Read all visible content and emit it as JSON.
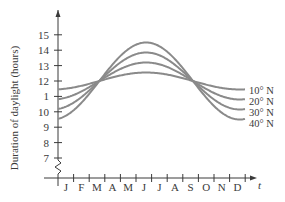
{
  "chart_data": {
    "type": "line",
    "title": "",
    "xlabel": "t",
    "ylabel": "Duration of daylight (hours)",
    "categories": [
      "J",
      "F",
      "M",
      "A",
      "M",
      "J",
      "J",
      "A",
      "S",
      "O",
      "N",
      "D"
    ],
    "yticks": [
      7,
      8,
      9,
      10,
      11,
      12,
      13,
      14,
      15
    ],
    "ytick_labels": [
      "7",
      "8",
      "9",
      "10",
      "1",
      "12",
      "13",
      "14",
      "15"
    ],
    "ylim": [
      6.5,
      16
    ],
    "axis_break": true,
    "grid": false,
    "legend_position": "right, inline at curve ends",
    "series": [
      {
        "name": "10° N",
        "amplitude": 0.55,
        "midline": 12.05,
        "values": [
          11.5,
          11.65,
          12.0,
          12.35,
          12.55,
          12.6,
          12.55,
          12.35,
          12.0,
          11.7,
          11.5,
          11.45
        ]
      },
      {
        "name": "20° N",
        "amplitude": 1.2,
        "midline": 12.1,
        "values": [
          10.9,
          11.3,
          12.0,
          12.7,
          13.2,
          13.3,
          13.2,
          12.7,
          12.0,
          11.3,
          10.9,
          10.8
        ]
      },
      {
        "name": "30° N",
        "amplitude": 1.85,
        "midline": 12.15,
        "values": [
          10.3,
          10.9,
          12.0,
          13.0,
          13.8,
          14.0,
          13.8,
          13.0,
          12.0,
          11.0,
          10.3,
          10.1
        ]
      },
      {
        "name": "40° N",
        "amplitude": 2.5,
        "midline": 12.3,
        "values": [
          9.8,
          10.5,
          12.0,
          13.4,
          14.5,
          14.8,
          14.5,
          13.4,
          12.0,
          10.6,
          9.8,
          9.5
        ]
      }
    ]
  },
  "legend": [
    "10° N",
    "20° N",
    "30° N",
    "40° N"
  ],
  "axis": {
    "y_title": "Duration of daylight (hours)",
    "x_title": "t"
  }
}
